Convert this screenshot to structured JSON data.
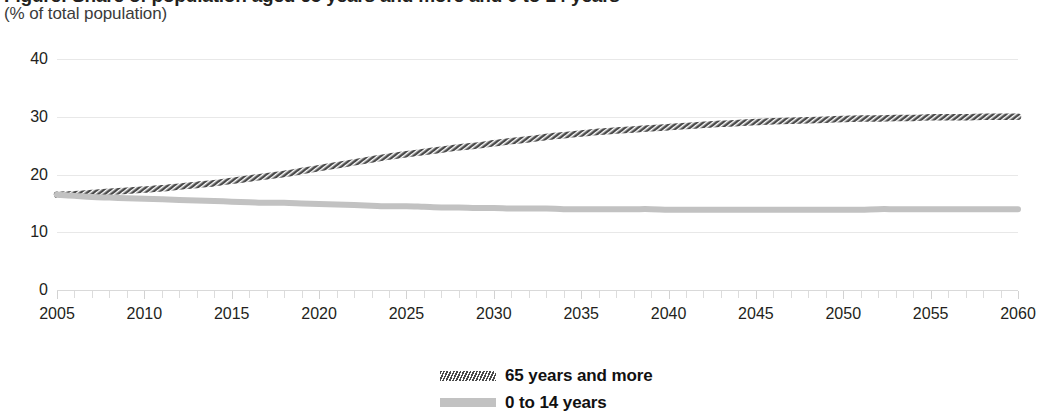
{
  "chart_data": {
    "type": "line",
    "title": "Figure: Share of population aged 65 years and more and 0 to 14 years",
    "subtitle": "(% of total population)",
    "xlabel": "",
    "ylabel": "",
    "ylim": [
      0,
      40
    ],
    "xlim": [
      2005,
      2060
    ],
    "yticks": [
      0,
      10,
      20,
      30,
      40
    ],
    "xticks": [
      2005,
      2010,
      2015,
      2020,
      2025,
      2030,
      2035,
      2040,
      2045,
      2050,
      2055,
      2060
    ],
    "minor_tick_step": 1,
    "grid": "horizontal",
    "legend_position": "bottom-center",
    "x": [
      2005,
      2006,
      2007,
      2008,
      2009,
      2010,
      2011,
      2012,
      2013,
      2014,
      2015,
      2016,
      2017,
      2018,
      2019,
      2020,
      2021,
      2022,
      2023,
      2024,
      2025,
      2026,
      2027,
      2028,
      2029,
      2030,
      2031,
      2032,
      2033,
      2034,
      2035,
      2036,
      2037,
      2038,
      2039,
      2040,
      2041,
      2042,
      2043,
      2044,
      2045,
      2046,
      2047,
      2048,
      2049,
      2050,
      2051,
      2052,
      2053,
      2054,
      2055,
      2056,
      2057,
      2058,
      2059,
      2060
    ],
    "series": [
      {
        "name": "65 years and more",
        "color": "#4a4a4a",
        "style": "hatched",
        "values": [
          16.5,
          16.6,
          16.8,
          17.0,
          17.2,
          17.4,
          17.6,
          17.9,
          18.2,
          18.5,
          18.9,
          19.3,
          19.7,
          20.1,
          20.6,
          21.1,
          21.6,
          22.1,
          22.6,
          23.1,
          23.5,
          23.9,
          24.3,
          24.7,
          25.0,
          25.4,
          25.8,
          26.1,
          26.5,
          26.8,
          27.1,
          27.4,
          27.6,
          27.8,
          28.0,
          28.2,
          28.4,
          28.6,
          28.8,
          28.9,
          29.1,
          29.2,
          29.3,
          29.4,
          29.5,
          29.6,
          29.7,
          29.7,
          29.8,
          29.8,
          29.9,
          29.9,
          29.9,
          30.0,
          30.0,
          30.0
        ]
      },
      {
        "name": "0 to 14 years",
        "color": "#c2c2c2",
        "style": "solid",
        "values": [
          16.5,
          16.3,
          16.1,
          16.0,
          15.9,
          15.8,
          15.7,
          15.6,
          15.5,
          15.4,
          15.3,
          15.2,
          15.1,
          15.1,
          15.0,
          14.9,
          14.8,
          14.7,
          14.6,
          14.5,
          14.5,
          14.4,
          14.3,
          14.3,
          14.2,
          14.2,
          14.1,
          14.1,
          14.1,
          14.0,
          14.0,
          14.0,
          14.0,
          14.0,
          14.0,
          13.9,
          13.9,
          13.9,
          13.9,
          13.9,
          13.9,
          13.9,
          13.9,
          13.9,
          13.9,
          13.9,
          13.9,
          14.0,
          14.0,
          14.0,
          14.0,
          14.0,
          14.0,
          14.0,
          14.0,
          14.0
        ]
      }
    ]
  },
  "legend": {
    "items": [
      {
        "label": "65 years and more"
      },
      {
        "label": "0 to 14 years"
      }
    ]
  }
}
